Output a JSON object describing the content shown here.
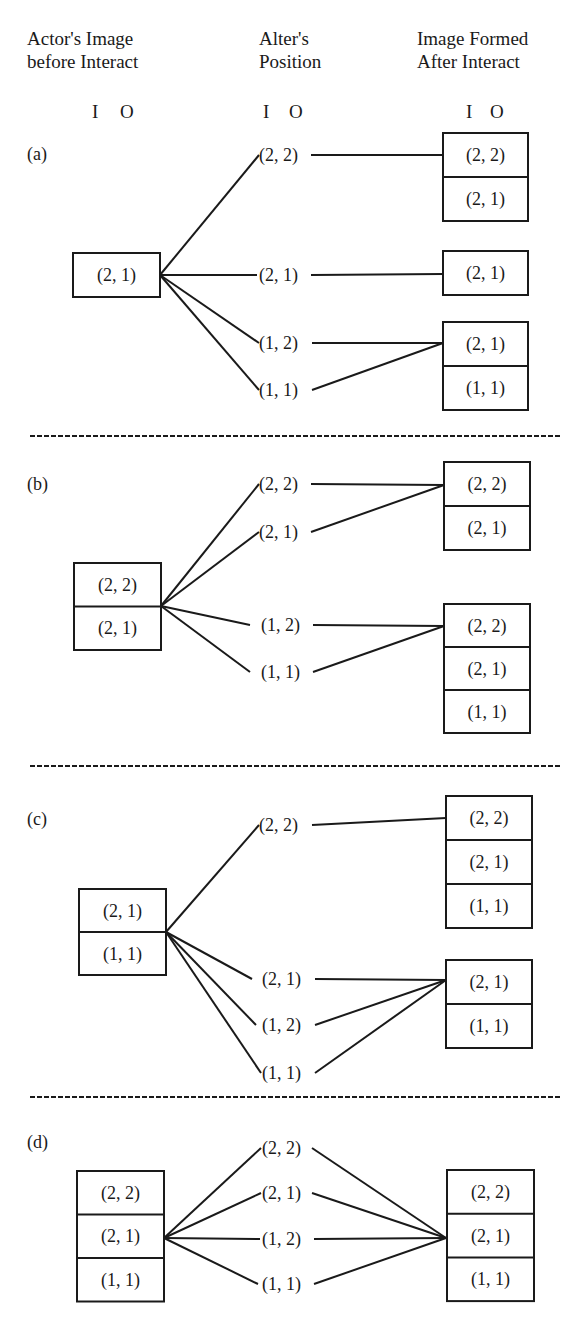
{
  "headers": {
    "actor": {
      "line1": "Actor's Image",
      "line2": "before Interact",
      "x": 27,
      "io_i_x": 92,
      "io_o_x": 120
    },
    "alter": {
      "line1": "Alter's",
      "line2": "Position",
      "x": 259,
      "io_i_x": 263,
      "io_o_x": 289
    },
    "formed": {
      "line1": "Image Formed",
      "line2": "After Interact",
      "x": 417,
      "io_i_x": 466,
      "io_o_x": 490
    },
    "io_labels": {
      "i": "I",
      "o": "O"
    }
  },
  "colors": {
    "ink": "#1a1a1a",
    "background": "#ffffff"
  },
  "separators": [
    436,
    766,
    1097
  ],
  "sections": [
    {
      "id": "a",
      "label": "(a)",
      "label_y": 160,
      "actor_box": {
        "x": 73,
        "y": 253,
        "w": 87,
        "cells": [
          "(2, 1)"
        ],
        "cell_h": 44
      },
      "origin": [
        160,
        275
      ],
      "alters": [
        {
          "text": "(2, 2)",
          "x": 259,
          "y": 155,
          "lx": 259,
          "rx": 311
        },
        {
          "text": "(2, 1)",
          "x": 259,
          "y": 275,
          "lx": 257,
          "rx": 311
        },
        {
          "text": "(1, 2)",
          "x": 259,
          "y": 343,
          "lx": 259,
          "rx": 312
        },
        {
          "text": "(1, 1)",
          "x": 259,
          "y": 390,
          "lx": 259,
          "rx": 312
        }
      ],
      "result_boxes": [
        {
          "x": 443,
          "y": 133,
          "w": 85,
          "cells": [
            "(2, 2)",
            "(2, 1)"
          ],
          "cell_h": 44,
          "target": [
            443,
            155
          ],
          "from": [
            0
          ]
        },
        {
          "x": 443,
          "y": 251,
          "w": 85,
          "cells": [
            "(2, 1)"
          ],
          "cell_h": 44,
          "target": [
            443,
            274
          ],
          "from": [
            1
          ]
        },
        {
          "x": 443,
          "y": 322,
          "w": 85,
          "cells": [
            "(2, 1)",
            "(1, 1)"
          ],
          "cell_h": 44,
          "target": [
            443,
            343
          ],
          "from": [
            2,
            3
          ]
        }
      ]
    },
    {
      "id": "b",
      "label": "(b)",
      "label_y": 490,
      "actor_box": {
        "x": 74,
        "y": 563,
        "w": 87,
        "cells": [
          "(2, 2)",
          "(2, 1)"
        ],
        "cell_h": 43.5
      },
      "origin": [
        161,
        606
      ],
      "alters": [
        {
          "text": "(2, 2)",
          "x": 259,
          "y": 484,
          "lx": 259,
          "rx": 311
        },
        {
          "text": "(2, 1)",
          "x": 259,
          "y": 532,
          "lx": 259,
          "rx": 311
        },
        {
          "text": "(1, 2)",
          "x": 261,
          "y": 625,
          "lx": 250,
          "rx": 313
        },
        {
          "text": "(1, 1)",
          "x": 261,
          "y": 672,
          "lx": 250,
          "rx": 313
        }
      ],
      "result_boxes": [
        {
          "x": 444,
          "y": 462,
          "w": 86,
          "cells": [
            "(2, 2)",
            "(2, 1)"
          ],
          "cell_h": 44,
          "target": [
            444,
            485
          ],
          "from": [
            0,
            1
          ]
        },
        {
          "x": 444,
          "y": 604,
          "w": 86,
          "cells": [
            "(2, 2)",
            "(2, 1)",
            "(1, 1)"
          ],
          "cell_h": 43,
          "target": [
            444,
            626
          ],
          "from": [
            2,
            3
          ]
        }
      ]
    },
    {
      "id": "c",
      "label": "(c)",
      "label_y": 825,
      "actor_box": {
        "x": 79,
        "y": 889,
        "w": 87,
        "cells": [
          "(2, 1)",
          "(1, 1)"
        ],
        "cell_h": 43
      },
      "origin": [
        166,
        932
      ],
      "alters": [
        {
          "text": "(2, 2)",
          "x": 259,
          "y": 825,
          "lx": 259,
          "rx": 312
        },
        {
          "text": "(2, 1)",
          "x": 262,
          "y": 979,
          "lx": 252,
          "rx": 315
        },
        {
          "text": "(1, 2)",
          "x": 262,
          "y": 1025,
          "lx": 256,
          "rx": 315
        },
        {
          "text": "(1, 1)",
          "x": 262,
          "y": 1073,
          "lx": 261,
          "rx": 315
        }
      ],
      "result_boxes": [
        {
          "x": 446,
          "y": 796,
          "w": 86,
          "cells": [
            "(2, 2)",
            "(2, 1)",
            "(1, 1)"
          ],
          "cell_h": 44,
          "target": [
            446,
            818
          ],
          "from": [
            0
          ]
        },
        {
          "x": 446,
          "y": 960,
          "w": 86,
          "cells": [
            "(2, 1)",
            "(1, 1)"
          ],
          "cell_h": 44,
          "target": [
            446,
            980
          ],
          "from": [
            1,
            2,
            3
          ]
        }
      ]
    },
    {
      "id": "d",
      "label": "(d)",
      "label_y": 1148,
      "actor_box": {
        "x": 77,
        "y": 1171,
        "w": 87,
        "cells": [
          "(2, 2)",
          "(2, 1)",
          "(1, 1)"
        ],
        "cell_h": 43.5
      },
      "origin": [
        164,
        1238
      ],
      "alters": [
        {
          "text": "(2, 2)",
          "x": 262,
          "y": 1148,
          "lx": 261,
          "rx": 312
        },
        {
          "text": "(2, 1)",
          "x": 262,
          "y": 1193,
          "lx": 261,
          "rx": 312
        },
        {
          "text": "(1, 2)",
          "x": 262,
          "y": 1239,
          "lx": 260,
          "rx": 314
        },
        {
          "text": "(1, 1)",
          "x": 262,
          "y": 1284,
          "lx": 258,
          "rx": 314
        }
      ],
      "result_boxes": [
        {
          "x": 447,
          "y": 1170,
          "w": 87,
          "cells": [
            "(2, 2)",
            "(2, 1)",
            "(1, 1)"
          ],
          "cell_h": 43.7,
          "target": [
            446,
            1238
          ],
          "from": [
            0,
            1,
            2,
            3
          ]
        }
      ]
    }
  ]
}
